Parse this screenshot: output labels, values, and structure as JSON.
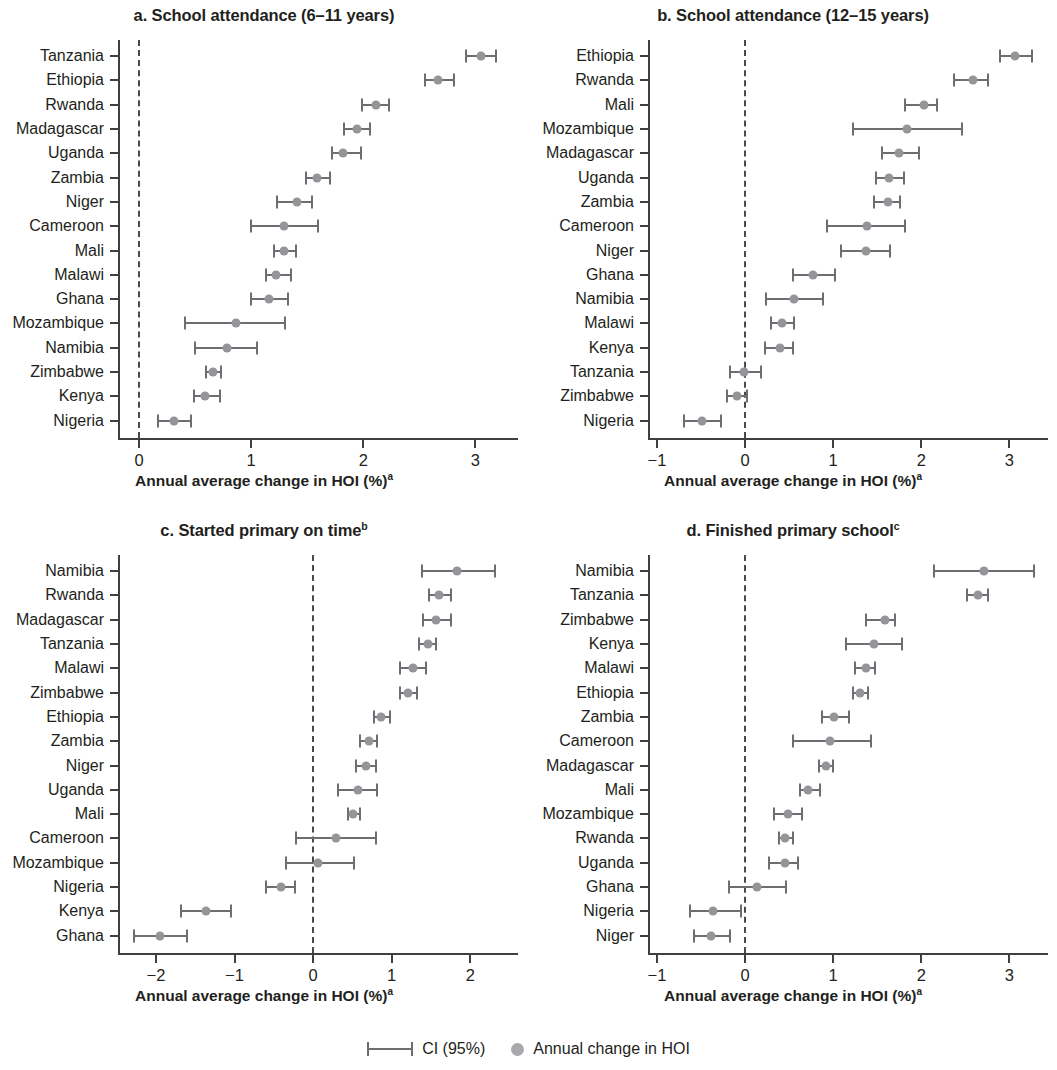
{
  "legend": {
    "ci_label": "CI (95%)",
    "point_label": "Annual change in HOI",
    "ci_color": "#6d6e70",
    "point_color": "#a7a9ac"
  },
  "axis_title": "Annual average change in HOI (%)",
  "axis_title_superscript": "a",
  "chart_data": [
    {
      "id": "a",
      "type": "scatter",
      "title": "a. School attendance (6–11 years)",
      "title_superscript": "",
      "xlabel": "Annual average change in HOI (%)",
      "xlabel_superscript": "a",
      "ylabel": "",
      "xlim": [
        -0.18,
        3.39
      ],
      "xticks": [
        0,
        1,
        2,
        3
      ],
      "xticklabels": [
        "0",
        "1",
        "2",
        "3"
      ],
      "grid": false,
      "reference_line": 0,
      "categories": [
        "Tanzania",
        "Ethiopia",
        "Rwanda",
        "Madagascar",
        "Uganda",
        "Zambia",
        "Niger",
        "Cameroon",
        "Mali",
        "Malawi",
        "Ghana",
        "Mozambique",
        "Namibia",
        "Zimbabwe",
        "Kenya",
        "Nigeria"
      ],
      "values": [
        3.06,
        2.68,
        2.12,
        1.95,
        1.83,
        1.6,
        1.42,
        1.3,
        1.3,
        1.23,
        1.17,
        0.87,
        0.79,
        0.67,
        0.6,
        0.32
      ],
      "ci_low": [
        2.92,
        2.55,
        1.99,
        1.83,
        1.72,
        1.49,
        1.23,
        1.0,
        1.2,
        1.13,
        1.0,
        0.41,
        0.5,
        0.6,
        0.49,
        0.17
      ],
      "ci_high": [
        3.2,
        2.83,
        2.25,
        2.08,
        2.0,
        1.72,
        1.56,
        1.61,
        1.42,
        1.37,
        1.35,
        1.32,
        1.07,
        0.75,
        0.74,
        0.48
      ]
    },
    {
      "id": "b",
      "type": "scatter",
      "title": "b. School attendance (12–15 years)",
      "title_superscript": "",
      "xlabel": "Annual average change in HOI (%)",
      "xlabel_superscript": "a",
      "ylabel": "",
      "xlim": [
        -1.09,
        3.45
      ],
      "xticks": [
        -1,
        0,
        1,
        2,
        3
      ],
      "xticklabels": [
        "−1",
        "0",
        "1",
        "2",
        "3"
      ],
      "grid": false,
      "reference_line": 0,
      "categories": [
        "Ethiopia",
        "Rwanda",
        "Mali",
        "Mozambique",
        "Madagascar",
        "Uganda",
        "Zambia",
        "Cameroon",
        "Niger",
        "Ghana",
        "Namibia",
        "Malawi",
        "Kenya",
        "Tanzania",
        "Zimbabwe",
        "Nigeria"
      ],
      "values": [
        3.08,
        2.6,
        2.04,
        1.85,
        1.76,
        1.65,
        1.63,
        1.4,
        1.38,
        0.78,
        0.57,
        0.43,
        0.41,
        0.0,
        -0.08,
        -0.48
      ],
      "ci_low": [
        2.89,
        2.37,
        1.82,
        1.23,
        1.56,
        1.49,
        1.46,
        0.93,
        1.09,
        0.54,
        0.24,
        0.3,
        0.23,
        -0.17,
        -0.2,
        -0.69
      ],
      "ci_high": [
        3.28,
        2.78,
        2.2,
        2.48,
        2.0,
        1.83,
        1.78,
        1.84,
        1.67,
        1.04,
        0.91,
        0.58,
        0.57,
        0.2,
        0.04,
        -0.25
      ]
    },
    {
      "id": "c",
      "type": "scatter",
      "title": "c. Started primary on time",
      "title_superscript": "b",
      "xlabel": "Annual average change in HOI (%)",
      "xlabel_superscript": "a",
      "ylabel": "",
      "xlim": [
        -2.47,
        2.62
      ],
      "xticks": [
        -2,
        -1,
        0,
        1,
        2
      ],
      "xticklabels": [
        "−2",
        "−1",
        "0",
        "1",
        "2"
      ],
      "grid": false,
      "reference_line": 0,
      "categories": [
        "Namibia",
        "Rwanda",
        "Madagascar",
        "Tanzania",
        "Malawi",
        "Zimbabwe",
        "Ethiopia",
        "Zambia",
        "Niger",
        "Uganda",
        "Mali",
        "Cameroon",
        "Mozambique",
        "Nigeria",
        "Kenya",
        "Ghana"
      ],
      "values": [
        1.85,
        1.62,
        1.58,
        1.47,
        1.28,
        1.22,
        0.88,
        0.72,
        0.68,
        0.58,
        0.52,
        0.3,
        0.08,
        -0.4,
        -1.35,
        -1.93
      ],
      "ci_low": [
        1.38,
        1.47,
        1.4,
        1.35,
        1.1,
        1.1,
        0.78,
        0.6,
        0.55,
        0.32,
        0.44,
        -0.22,
        -0.35,
        -0.6,
        -1.68,
        -2.28
      ],
      "ci_high": [
        2.34,
        1.78,
        1.78,
        1.59,
        1.46,
        1.35,
        1.0,
        0.84,
        0.82,
        0.84,
        0.62,
        0.82,
        0.55,
        -0.2,
        -1.02,
        -1.58
      ]
    },
    {
      "id": "d",
      "type": "scatter",
      "title": "d. Finished primary school",
      "title_superscript": "c",
      "xlabel": "Annual average change in HOI (%)",
      "xlabel_superscript": "a",
      "ylabel": "",
      "xlim": [
        -1.09,
        3.45
      ],
      "xticks": [
        -1,
        0,
        1,
        2,
        3
      ],
      "xticklabels": [
        "−1",
        "0",
        "1",
        "2",
        "3"
      ],
      "grid": false,
      "reference_line": 0,
      "categories": [
        "Namibia",
        "Tanzania",
        "Zimbabwe",
        "Kenya",
        "Malawi",
        "Ethiopia",
        "Zambia",
        "Cameroon",
        "Madagascar",
        "Mali",
        "Mozambique",
        "Rwanda",
        "Uganda",
        "Ghana",
        "Nigeria",
        "Niger"
      ],
      "values": [
        2.72,
        2.66,
        1.6,
        1.48,
        1.38,
        1.32,
        1.02,
        0.98,
        0.93,
        0.73,
        0.5,
        0.47,
        0.46,
        0.15,
        -0.35,
        -0.37
      ],
      "ci_low": [
        2.14,
        2.52,
        1.37,
        1.15,
        1.25,
        1.22,
        0.87,
        0.55,
        0.84,
        0.62,
        0.33,
        0.39,
        0.27,
        -0.18,
        -0.62,
        -0.58
      ],
      "ci_high": [
        3.3,
        2.78,
        1.73,
        1.8,
        1.5,
        1.42,
        1.2,
        1.45,
        1.02,
        0.87,
        0.67,
        0.57,
        0.62,
        0.49,
        -0.02,
        -0.15
      ]
    }
  ]
}
